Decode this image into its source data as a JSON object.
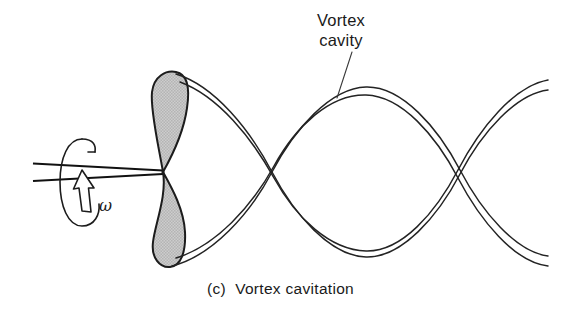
{
  "figure": {
    "caption": "(c)  Vortex cavitation",
    "caption_index": "(c)",
    "caption_title": "Vortex cavitation",
    "background_color": "#ffffff",
    "width": 561,
    "height": 315
  },
  "annotations": {
    "vortex_cavity_label": "Vortex\ncavity",
    "vortex_cavity_line1": "Vortex",
    "vortex_cavity_line2": "cavity",
    "omega_symbol": "ω"
  },
  "diagram": {
    "type": "engineering-schematic",
    "ink_color": "#1c1c1c",
    "blade_fill_color": "#c9c9c9",
    "blade_outline_color": "#1c1c1c",
    "shaft": {
      "label": "drive-shaft",
      "top_line_y": 163,
      "bottom_line_y": 181,
      "x_start": 33,
      "x_end": 163
    },
    "rotation_indicator": {
      "label": "angular-velocity-arrow",
      "symbol": "ω",
      "center_x": 78,
      "center_y": 182,
      "rx": 17,
      "ry": 45,
      "direction": "counterclockwise-about-shaft"
    },
    "propeller": {
      "label": "two-bladed-propeller",
      "hub_x": 163,
      "hub_y": 172,
      "blade_count": 2,
      "upper_blade_tip_y": 73,
      "lower_blade_tip_y": 268,
      "blade_max_half_width": 24
    },
    "vortex": {
      "label": "helical-tip-vortex-cavity",
      "strand_count": 2,
      "tube_wall_lines_per_strand": 2,
      "crossing_points_x": [
        272,
        455
      ],
      "upper_peak_y": 86,
      "lower_trough_y": 258,
      "axis_y": 172,
      "x_start": 178,
      "x_end": 556,
      "wavelength": 183
    },
    "leader": {
      "label": "vortex-cavity-leader-line",
      "from_x": 352,
      "from_y": 52,
      "to_x": 338,
      "to_y": 97
    }
  }
}
